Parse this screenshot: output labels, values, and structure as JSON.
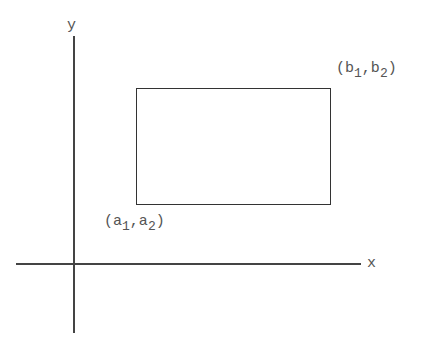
{
  "diagram": {
    "axes": {
      "x_label": "x",
      "y_label": "y"
    },
    "rectangle": {
      "lower_left": {
        "open": "(",
        "a": "a",
        "a_sub": "1",
        "sep": ",",
        "b": "a",
        "b_sub": "2",
        "close": ")"
      },
      "upper_right": {
        "open": "(",
        "a": "b",
        "a_sub": "1",
        "sep": ",",
        "b": "b",
        "b_sub": "2",
        "close": ")"
      }
    }
  },
  "colors": {
    "line": "#444444",
    "text": "#555555",
    "background": "#ffffff"
  }
}
